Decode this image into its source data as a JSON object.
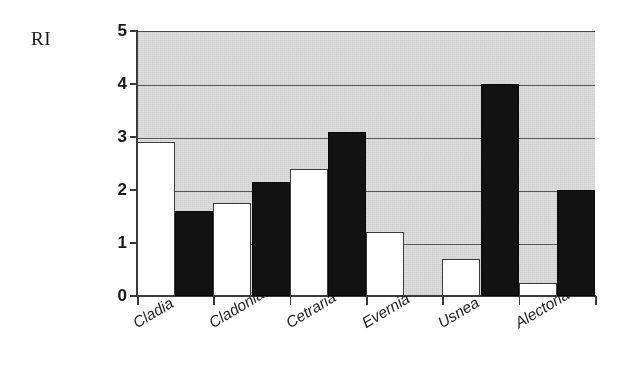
{
  "chart_data": {
    "type": "bar",
    "title": "",
    "subtitle": "",
    "xlabel": "",
    "ylabel": "RI",
    "ylim": [
      0,
      5
    ],
    "yticks": [
      0,
      1,
      2,
      3,
      4,
      5
    ],
    "ytick_labels": [
      "0",
      "1",
      "2",
      "3",
      "4",
      "5"
    ],
    "grid": true,
    "grid_axis": "y",
    "legend": false,
    "legend_position": "none",
    "categories": [
      "Cladia",
      "Cladonia",
      "Cetraria",
      "Evernia",
      "Usnea",
      "Alectoria"
    ],
    "series": [
      {
        "name": "series-1",
        "color": "#ffffff",
        "edge_color": "#3c3c3c",
        "values": [
          2.9,
          1.75,
          2.4,
          1.2,
          0.7,
          0.25
        ]
      },
      {
        "name": "series-2",
        "color": "#121212",
        "edge_color": "#080808",
        "values": [
          1.6,
          2.15,
          3.1,
          0,
          4.0,
          2.0
        ]
      }
    ],
    "plot_background": "#dedede",
    "gridline_color": "#55555a",
    "axis_color": "#3a3a3a"
  },
  "axes": {
    "y_title": "RI"
  }
}
